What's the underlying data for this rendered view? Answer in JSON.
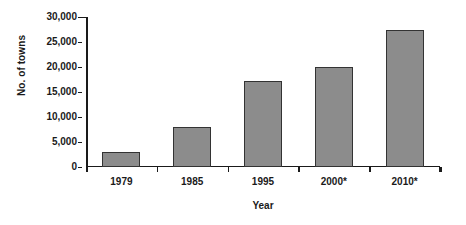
{
  "chart_data": {
    "type": "bar",
    "title": "",
    "subtitle": "",
    "categories": [
      "1979",
      "1985",
      "1995",
      "2000*",
      "2010*"
    ],
    "values": [
      3000,
      8000,
      17200,
      20000,
      27500
    ],
    "xlabel": "Year",
    "ylabel": "No. of towns",
    "ylim": [
      0,
      30000
    ],
    "yticks": [
      0,
      5000,
      10000,
      15000,
      20000,
      25000,
      30000
    ],
    "ytick_labels": [
      "0",
      "5,000",
      "10,000",
      "15,000",
      "20,000",
      "25,000",
      "30,000"
    ],
    "grid": false,
    "legend": false,
    "legend_position": "none",
    "annotations": [],
    "series": [
      {
        "name": "No. of towns",
        "values": [
          3000,
          8000,
          17200,
          20000,
          27500
        ]
      }
    ]
  },
  "style": {
    "bar_fill": "#8c8c8c",
    "bar_border": "#333333",
    "axis_color": "#1a1a1a",
    "background": "#ffffff"
  }
}
